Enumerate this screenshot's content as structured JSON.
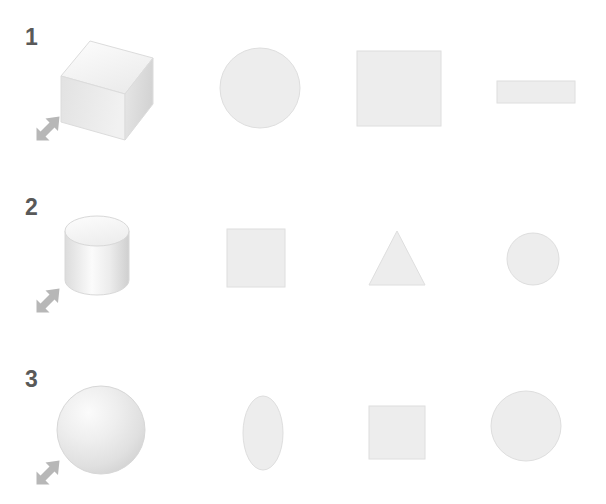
{
  "figure": {
    "type": "diagram",
    "title_visible": false,
    "background_color": "#ffffff",
    "label_color": "#595959",
    "shape_fill_color": "#ededed",
    "shape_stroke_color": "#d6d6d6",
    "arrow_color": "#b3b3b3",
    "rows": [
      {
        "label": "1",
        "arrow": {
          "name": "view-direction-arrow",
          "direction": "up-right"
        },
        "solid": {
          "name": "cube",
          "label": "cube"
        },
        "views": [
          {
            "name": "circle",
            "label": "circle"
          },
          {
            "name": "square",
            "label": "square"
          },
          {
            "name": "thin-rectangle",
            "label": "rectangle"
          }
        ]
      },
      {
        "label": "2",
        "arrow": {
          "name": "view-direction-arrow",
          "direction": "up-right"
        },
        "solid": {
          "name": "cylinder",
          "label": "cylinder"
        },
        "views": [
          {
            "name": "square",
            "label": "square"
          },
          {
            "name": "triangle",
            "label": "triangle"
          },
          {
            "name": "circle",
            "label": "circle"
          }
        ]
      },
      {
        "label": "3",
        "arrow": {
          "name": "view-direction-arrow",
          "direction": "up-right"
        },
        "solid": {
          "name": "sphere",
          "label": "sphere"
        },
        "views": [
          {
            "name": "ellipse",
            "label": "oval"
          },
          {
            "name": "square",
            "label": "square"
          },
          {
            "name": "circle",
            "label": "circle"
          }
        ]
      }
    ]
  }
}
